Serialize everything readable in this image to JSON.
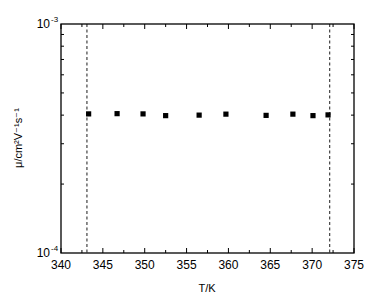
{
  "chart_data": {
    "type": "scatter",
    "title": "",
    "xlabel": "T/K",
    "ylabel": "μ/cm²V⁻¹s⁻¹",
    "xlim": [
      340,
      375
    ],
    "ylim": [
      0.0001,
      0.001
    ],
    "yscale": "log",
    "xticks": [
      340,
      345,
      350,
      355,
      360,
      365,
      370,
      375
    ],
    "xtick_labels": [
      "340",
      "345",
      "350",
      "355",
      "360",
      "365",
      "370",
      "375"
    ],
    "yticks": [
      0.0001,
      0.001
    ],
    "ytick_labels": [
      {
        "base": "10",
        "exp": "-4"
      },
      {
        "base": "10",
        "exp": "-3"
      }
    ],
    "grid": false,
    "legend": null,
    "marker": "filled-square",
    "series": [
      {
        "name": "mobility",
        "x": [
          343.3,
          346.7,
          349.8,
          352.5,
          356.5,
          359.7,
          364.5,
          367.7,
          370.1,
          371.9
        ],
        "y": [
          0.000405,
          0.000406,
          0.000405,
          0.000398,
          0.0004,
          0.000404,
          0.000399,
          0.000404,
          0.000398,
          0.000401
        ]
      }
    ],
    "annotations": [
      {
        "type": "vertical-dashed-line",
        "x": 343.1
      },
      {
        "type": "vertical-dashed-line",
        "x": 372.1
      }
    ]
  }
}
